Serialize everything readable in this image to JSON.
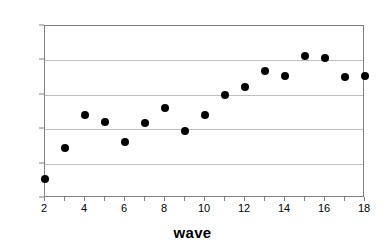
{
  "chart_data": {
    "type": "scatter",
    "title": "",
    "xlabel": "wave",
    "ylabel": "",
    "x": [
      2,
      3,
      4,
      5,
      6,
      7,
      8,
      9,
      10,
      11,
      12,
      13,
      14,
      15,
      16,
      17,
      18
    ],
    "values": [
      0.278,
      0.323,
      0.37,
      0.361,
      0.331,
      0.359,
      0.381,
      0.348,
      0.371,
      0.4,
      0.412,
      0.434,
      0.428,
      0.457,
      0.453,
      0.426,
      0.428
    ],
    "series": [
      {
        "name": "wave",
        "values": [
          0.278,
          0.323,
          0.37,
          0.361,
          0.331,
          0.359,
          0.381,
          0.348,
          0.371,
          0.4,
          0.412,
          0.434,
          0.428,
          0.457,
          0.453,
          0.426,
          0.428
        ]
      }
    ],
    "xlim": [
      2,
      18
    ],
    "ylim": [
      0.25,
      0.5
    ],
    "xticks": [
      2,
      4,
      6,
      8,
      10,
      12,
      14,
      16,
      18
    ],
    "xtick_labels": [
      "2",
      "4",
      "6",
      "8",
      "10",
      "12",
      "14",
      "16",
      "18"
    ],
    "xminor_ticks": [
      2,
      3,
      4,
      5,
      6,
      7,
      8,
      9,
      10,
      11,
      12,
      13,
      14,
      15,
      16,
      17,
      18
    ],
    "yticks": [
      0.25,
      0.3,
      0.35,
      0.4,
      0.45,
      0.5
    ],
    "ytick_labels": [
      "0,25",
      "0,30",
      "0,35",
      "0,40",
      "0,45",
      "0,50"
    ],
    "grid": "horizontal",
    "legend": "none",
    "marker": "filled-circle",
    "marker_color": "#000000",
    "gridline_color": "#bfbfbf",
    "frame_color": "#808080",
    "background_color": "#ffffff",
    "decimal_separator": ","
  }
}
